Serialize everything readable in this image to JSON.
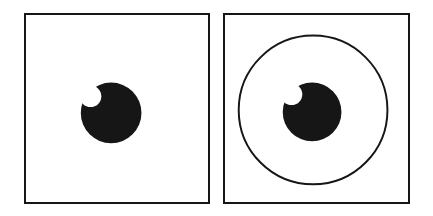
{
  "figure": {
    "title": "",
    "caption": "",
    "background_color": "#ffffff",
    "ink_color": "#161616",
    "width": 433,
    "height": 216,
    "panel_count": 2
  },
  "panels": [
    {
      "id": "panel-a",
      "label": "",
      "position": "left",
      "frame": {
        "x": 24,
        "y": 13,
        "width": 186,
        "height": 191,
        "border_width": 2,
        "border_color": "#161616",
        "fill": "#ffffff"
      },
      "elements": [
        {
          "name": "bitten-disk",
          "type": "disk-with-notch",
          "fill": "#161616",
          "center_x": 111,
          "center_y": 113,
          "radius": 31,
          "notch": {
            "name": "bite-notch",
            "center_x": 90,
            "center_y": 96,
            "radius": 11,
            "fill": "#ffffff",
            "position": "upper-left"
          }
        }
      ]
    },
    {
      "id": "panel-b",
      "label": "",
      "position": "right",
      "frame": {
        "x": 223,
        "y": 13,
        "width": 187,
        "height": 191,
        "border_width": 2,
        "border_color": "#161616",
        "fill": "#ffffff"
      },
      "elements": [
        {
          "name": "surrounding-circle",
          "type": "circle-outline",
          "stroke": "#161616",
          "stroke_width": 2,
          "fill": "none",
          "center_x": 313,
          "center_y": 110,
          "radius": 76
        },
        {
          "name": "bitten-disk",
          "type": "disk-with-notch",
          "fill": "#161616",
          "center_x": 312,
          "center_y": 112,
          "radius": 30,
          "notch": {
            "name": "bite-notch",
            "center_x": 291,
            "center_y": 94,
            "radius": 11,
            "fill": "#ffffff",
            "position": "upper-left"
          }
        }
      ]
    }
  ]
}
